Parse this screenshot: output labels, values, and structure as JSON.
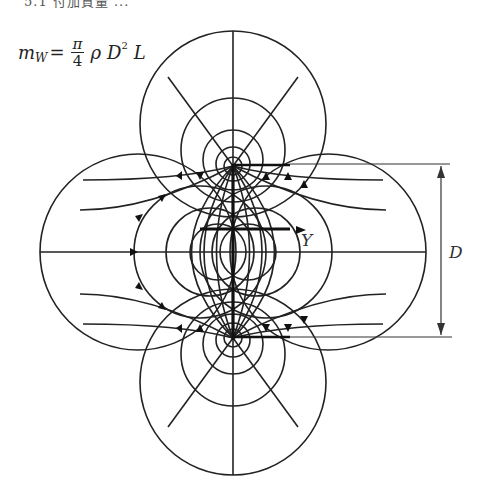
{
  "header": {
    "cut_heading": "5.1 付加質量 ..."
  },
  "formula": {
    "lhs": "m",
    "lhs_sub": "W",
    "eq": "=",
    "frac_num": "π",
    "frac_den": "4",
    "rho": "ρ",
    "D": "D",
    "D_sup": "2",
    "L": "L"
  },
  "diagram": {
    "labels": {
      "plate": "Y",
      "dimension": "D"
    },
    "colors": {
      "stroke": "#222222",
      "background": "#ffffff"
    },
    "geometry": {
      "center": [
        233,
        252
      ],
      "plate_half_length": 86,
      "dimension_line_x": 441,
      "dimension_top_y": 164,
      "dimension_bottom_y": 337
    }
  }
}
